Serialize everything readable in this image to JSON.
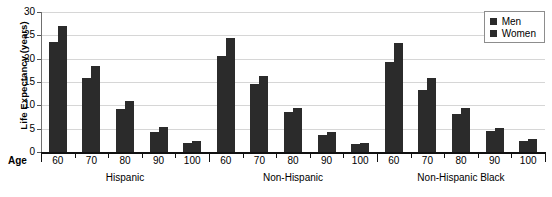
{
  "chart_data": {
    "type": "bar",
    "title": "",
    "xlabel": "Age",
    "ylabel": "Life Expectancy (years)",
    "ylim": [
      0,
      30
    ],
    "yticks": [
      0,
      5,
      10,
      15,
      20,
      25,
      30
    ],
    "grid": true,
    "legend_position": "top-right",
    "legend": [
      "Men",
      "Women"
    ],
    "group_label_axis": "Ethnicity",
    "groups": [
      {
        "name": "Hispanic",
        "categories": [
          "60",
          "70",
          "80",
          "90",
          "100"
        ],
        "series": [
          {
            "name": "Men",
            "values": [
              23.5,
              15.8,
              9.3,
              4.3,
              2.0
            ]
          },
          {
            "name": "Women",
            "values": [
              27.0,
              18.5,
              11.0,
              5.3,
              2.4
            ]
          }
        ]
      },
      {
        "name": "Non-Hispanic",
        "categories": [
          "60",
          "70",
          "80",
          "90",
          "100"
        ],
        "series": [
          {
            "name": "Men",
            "values": [
              20.5,
              14.5,
              8.5,
              3.7,
              1.7
            ]
          },
          {
            "name": "Women",
            "values": [
              24.5,
              16.3,
              9.5,
              4.3,
              2.0
            ]
          }
        ]
      },
      {
        "name": "Non-Hispanic Black",
        "categories": [
          "60",
          "70",
          "80",
          "90",
          "100"
        ],
        "series": [
          {
            "name": "Men",
            "values": [
              19.3,
              13.3,
              8.1,
              4.5,
              2.4
            ]
          },
          {
            "name": "Women",
            "values": [
              23.3,
              15.8,
              9.5,
              5.1,
              2.7
            ]
          }
        ]
      }
    ],
    "colors": {
      "bar": "#2b2b2b",
      "grid": "#d6d6d6",
      "axis": "#111111",
      "background": "#ffffff"
    }
  },
  "axis": {
    "age_label": "Age"
  }
}
